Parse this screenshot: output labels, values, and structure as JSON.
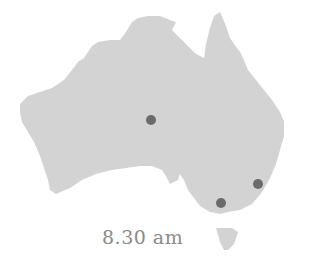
{
  "map": {
    "region": "Australia",
    "land_color": "#d3d3d3",
    "marker_color": "#6b6b6b",
    "markers": [
      {
        "name": "central-australia",
        "cx": 151,
        "cy": 120
      },
      {
        "name": "sydney",
        "cx": 258,
        "cy": 184
      },
      {
        "name": "melbourne",
        "cx": 221,
        "cy": 203
      }
    ]
  },
  "caption": {
    "time": "8.30 am"
  }
}
